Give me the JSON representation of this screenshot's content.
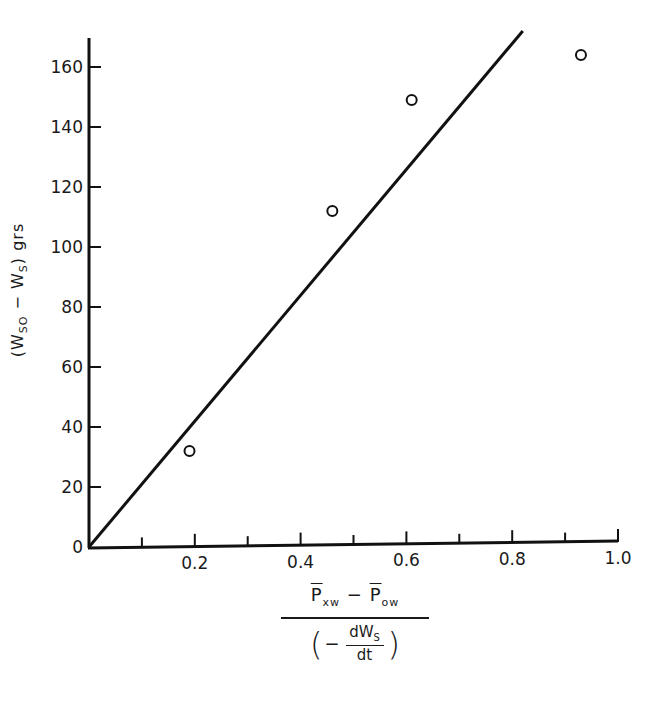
{
  "chart_data": {
    "type": "scatter",
    "title": "",
    "xlabel": "(P̄xw − P̄ow) / (−dWs/dt)",
    "ylabel": "(Wso − Ws) grs",
    "xlim": [
      0,
      1.0
    ],
    "ylim": [
      0,
      170
    ],
    "grid": false,
    "legend": null,
    "x_ticks": [
      0.1,
      0.2,
      0.3,
      0.4,
      0.5,
      0.6,
      0.7,
      0.8,
      0.9,
      1.0
    ],
    "x_tick_labels": [
      "",
      "0.2",
      "",
      "0.4",
      "",
      "0.6",
      "",
      "0.8",
      "",
      "1.0"
    ],
    "y_ticks": [
      0,
      20,
      40,
      60,
      80,
      100,
      120,
      140,
      160
    ],
    "y_tick_labels": [
      "0",
      "20",
      "40",
      "60",
      "80",
      "100",
      "120",
      "140",
      "160"
    ],
    "series": [
      {
        "name": "observed",
        "type": "scatter",
        "marker": "open-circle",
        "x": [
          0.19,
          0.46,
          0.61,
          0.93
        ],
        "y": [
          32,
          112,
          149,
          164
        ]
      },
      {
        "name": "fitted line",
        "type": "line",
        "x": [
          0,
          0.82
        ],
        "y": [
          0,
          172
        ]
      }
    ]
  },
  "labels": {
    "y_main": "(W",
    "y_sub1": "SO",
    "y_mid": " − W",
    "y_sub2": "S",
    "y_tail": ")   grs",
    "x_num_p1": "P",
    "x_num_sub1": "xw",
    "x_num_minus": " − ",
    "x_num_p2": "P",
    "x_num_sub2": "ow",
    "x_den_open": "(",
    "x_den_minus": "−",
    "x_den_top": "dW",
    "x_den_top_sub": "S",
    "x_den_bottom": "dt",
    "x_den_close": ")"
  }
}
